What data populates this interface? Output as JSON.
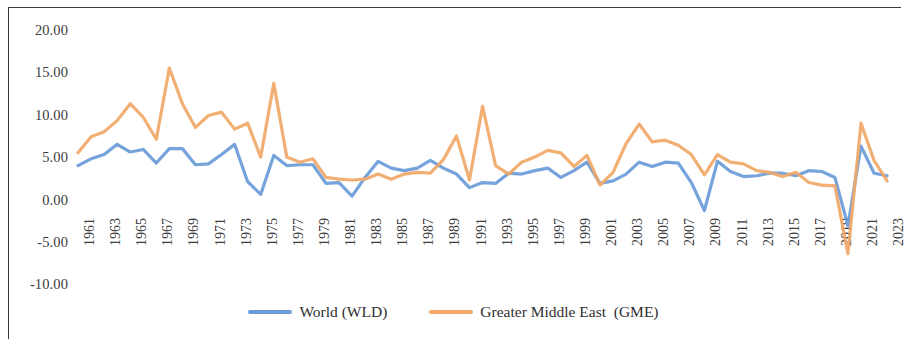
{
  "chart_data": {
    "type": "line",
    "title": "",
    "xlabel": "",
    "ylabel": "",
    "ylim": [
      -10,
      20
    ],
    "xlim": [
      1961,
      2023
    ],
    "grid": false,
    "legend_position": "bottom-center",
    "y_ticks": [
      "20.00",
      "15.00",
      "10.00",
      "5.00",
      "0.00",
      "-5.00",
      "-10.00"
    ],
    "y_tick_values": [
      20,
      15,
      10,
      5,
      0,
      -5,
      -10
    ],
    "x_tick_labels": [
      "1961",
      "1963",
      "1965",
      "1967",
      "1969",
      "1971",
      "1973",
      "1975",
      "1977",
      "1979",
      "1981",
      "1983",
      "1985",
      "1987",
      "1989",
      "1991",
      "1993",
      "1995",
      "1997",
      "1999",
      "2001",
      "2003",
      "2005",
      "2007",
      "2009",
      "2011",
      "2013",
      "2015",
      "2017",
      "2019",
      "2021",
      "2023"
    ],
    "x": [
      1961,
      1962,
      1963,
      1964,
      1965,
      1966,
      1967,
      1968,
      1969,
      1970,
      1971,
      1972,
      1973,
      1974,
      1975,
      1976,
      1977,
      1978,
      1979,
      1980,
      1981,
      1982,
      1983,
      1984,
      1985,
      1986,
      1987,
      1988,
      1989,
      1990,
      1991,
      1992,
      1993,
      1994,
      1995,
      1996,
      1997,
      1998,
      1999,
      2000,
      2001,
      2002,
      2003,
      2004,
      2005,
      2006,
      2007,
      2008,
      2009,
      2010,
      2011,
      2012,
      2013,
      2014,
      2015,
      2016,
      2017,
      2018,
      2019,
      2020,
      2021,
      2022,
      2023
    ],
    "series": [
      {
        "name": "World (WLD)",
        "color": "#6A9BD8",
        "values": [
          4.0,
          4.8,
          5.3,
          6.5,
          5.6,
          5.9,
          4.3,
          6.0,
          6.0,
          4.1,
          4.2,
          5.3,
          6.5,
          2.1,
          0.6,
          5.2,
          4.0,
          4.1,
          4.1,
          1.9,
          2.0,
          0.4,
          2.6,
          4.5,
          3.7,
          3.4,
          3.7,
          4.6,
          3.7,
          3.0,
          1.4,
          2.0,
          1.9,
          3.1,
          3.0,
          3.4,
          3.7,
          2.6,
          3.4,
          4.4,
          1.9,
          2.2,
          3.0,
          4.4,
          3.9,
          4.4,
          4.3,
          2.0,
          -1.3,
          4.5,
          3.3,
          2.7,
          2.8,
          3.1,
          3.1,
          2.8,
          3.4,
          3.3,
          2.6,
          -3.1,
          6.3,
          3.1,
          2.8
        ]
      },
      {
        "name": "Greater Middle East  (GME)",
        "color": "#F0A868",
        "values": [
          5.5,
          7.4,
          8.0,
          9.3,
          11.3,
          9.7,
          7.1,
          15.5,
          11.3,
          8.5,
          9.9,
          10.3,
          8.3,
          9.0,
          5.0,
          13.7,
          5.0,
          4.4,
          4.8,
          2.6,
          2.4,
          2.3,
          2.4,
          3.0,
          2.4,
          3.0,
          3.2,
          3.1,
          4.7,
          7.5,
          2.3,
          11.0,
          4.0,
          3.0,
          4.4,
          5.0,
          5.8,
          5.5,
          3.9,
          5.2,
          1.7,
          3.2,
          6.6,
          8.9,
          6.8,
          7.0,
          6.4,
          5.3,
          2.9,
          5.3,
          4.4,
          4.2,
          3.4,
          3.2,
          2.7,
          3.2,
          2.0,
          1.7,
          1.6,
          -6.4,
          9.0,
          4.6,
          2.2
        ]
      }
    ]
  },
  "legend": {
    "items": [
      {
        "label": "World (WLD)",
        "color": "#6A9BD8"
      },
      {
        "label": "Greater Middle East  (GME)",
        "color": "#F0A868"
      }
    ]
  }
}
